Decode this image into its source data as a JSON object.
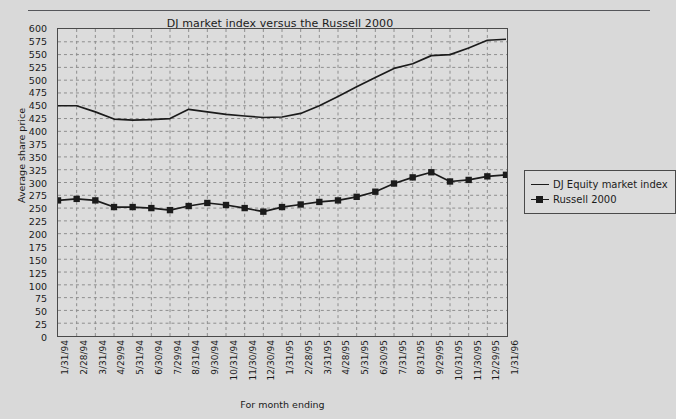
{
  "chart_title": "DJ market index versus the Russell 2000",
  "axes": {
    "xlabel": "For month ending",
    "ylabel": "Average share price"
  },
  "legend": {
    "position": "right",
    "entries": [
      {
        "label": "DJ Equity market index",
        "marker": "none",
        "key_icon": "line-key-icon"
      },
      {
        "label": "Russell 2000",
        "marker": "square",
        "key_icon": "line-marker-key-icon"
      }
    ]
  },
  "chart_data": {
    "type": "line",
    "title": "DJ market index versus the Russell 2000",
    "xlabel": "For month ending",
    "ylabel": "Average share price",
    "ylim": [
      0,
      600
    ],
    "ytick_step": 25,
    "grid": true,
    "grid_style": "dashed",
    "categories": [
      "1/31/94",
      "2/28/94",
      "3/31/94",
      "4/29/94",
      "5/31/94",
      "6/30/94",
      "7/29/94",
      "8/31/94",
      "9/30/94",
      "10/31/94",
      "11/30/94",
      "12/30/94",
      "1/31/95",
      "2/28/95",
      "3/31/95",
      "4/28/95",
      "5/31/95",
      "6/30/95",
      "7/31/95",
      "8/31/95",
      "9/29/95",
      "10/31/95",
      "11/30/95",
      "12/29/95",
      "1/31/96"
    ],
    "yticks": [
      0,
      25,
      50,
      75,
      100,
      125,
      150,
      175,
      200,
      225,
      250,
      275,
      300,
      325,
      350,
      375,
      400,
      425,
      450,
      475,
      500,
      525,
      550,
      575,
      600
    ],
    "series": [
      {
        "name": "DJ Equity market index",
        "color": "#1b1b1b",
        "marker": "none",
        "values": [
          450,
          450,
          438,
          424,
          422,
          423,
          425,
          443,
          438,
          433,
          430,
          427,
          428,
          435,
          450,
          468,
          487,
          505,
          523,
          532,
          548,
          550,
          563,
          578,
          580
        ]
      },
      {
        "name": "Russell 2000",
        "color": "#1b1b1b",
        "marker": "square",
        "values": [
          265,
          268,
          265,
          252,
          252,
          250,
          246,
          254,
          260,
          256,
          250,
          243,
          252,
          257,
          262,
          265,
          272,
          282,
          298,
          310,
          320,
          302,
          305,
          312,
          315
        ]
      }
    ]
  }
}
